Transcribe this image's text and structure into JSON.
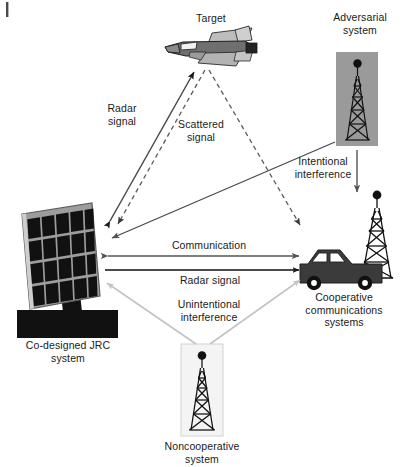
{
  "figure": {
    "kind": "joint-radar-communication-coexistence-diagram",
    "corner_mark": "",
    "background": "#ffffff",
    "ink": "#1a1a1a"
  },
  "nodes": {
    "target": {
      "label_lines": [
        "Target"
      ],
      "icon": "fighter-jet-icon",
      "colors": {
        "body": "#6f6f6f",
        "wing": "#b9b9b9",
        "dark": "#3a3a3a",
        "outline": "#1a1a1a"
      }
    },
    "adversarial": {
      "label_lines": [
        "Adversarial",
        "system"
      ],
      "icon": "lattice-tower-icon",
      "colors": {
        "panel": "#9a9a9a",
        "tower": "#111111"
      }
    },
    "jrc": {
      "label_lines": [
        "Co-designed JRC",
        "system"
      ],
      "icon": "phased-array-panel-icon",
      "colors": {
        "frame": "#9d9d9d",
        "cell": "#111111",
        "base": "#111111"
      },
      "grid": {
        "rows": 4,
        "cols": 5
      }
    },
    "cooperative": {
      "label_lines": [
        "Cooperative",
        "communications",
        "systems"
      ],
      "icon": "car-with-tower-icon",
      "colors": {
        "car": "#3b3b3b",
        "tower": "#111111",
        "window": "#ffffff"
      }
    },
    "noncooperative": {
      "label_lines": [
        "Noncooperative",
        "system"
      ],
      "icon": "lattice-tower-icon",
      "colors": {
        "panel": "#f2f2f2",
        "border": "#cfcfcf",
        "tower": "#111111"
      }
    }
  },
  "edges": [
    {
      "id": "radar-signal-to-target",
      "label_lines": [
        "Radar",
        "signal"
      ],
      "style": "solid",
      "color": "#4a4a4a",
      "arrows": "both",
      "from": "jrc",
      "to": "target"
    },
    {
      "id": "scattered-signal-to-jrc",
      "label_lines": [
        "Scattered",
        "signal"
      ],
      "style": "dashed",
      "color": "#5a5a5a",
      "arrows": "end",
      "from": "target",
      "to": "jrc"
    },
    {
      "id": "scattered-signal-to-cooperative",
      "label_lines": [],
      "style": "dashed",
      "color": "#5a5a5a",
      "arrows": "end",
      "from": "target",
      "to": "cooperative"
    },
    {
      "id": "intentional-interference-to-jrc",
      "label_lines": [
        "Intentional",
        "interference"
      ],
      "style": "solid",
      "color": "#4a4a4a",
      "arrows": "end",
      "from": "adversarial",
      "to": "jrc"
    },
    {
      "id": "intentional-interference-to-cooperative",
      "label_lines": [],
      "style": "solid",
      "color": "#5f5f5f",
      "arrows": "end",
      "from": "adversarial",
      "to": "cooperative"
    },
    {
      "id": "communication-link",
      "label_lines": [
        "Communication"
      ],
      "style": "solid",
      "color": "#555555",
      "arrows": "both",
      "from": "jrc",
      "to": "cooperative"
    },
    {
      "id": "radar-signal-link",
      "label_lines": [
        "Radar signal"
      ],
      "style": "solid",
      "color": "#111111",
      "arrows": "end",
      "from": "jrc",
      "to": "cooperative"
    },
    {
      "id": "unintentional-interference",
      "label_lines": [
        "Unintentional",
        "interference"
      ],
      "style": "solid",
      "color": "#c3c3c3",
      "arrows": "both-outward",
      "from": "noncooperative",
      "to": "jrc-and-cooperative"
    }
  ],
  "labels": {
    "target": "Target",
    "adversarial_1": "Adversarial",
    "adversarial_2": "system",
    "radar_signal_1": "Radar",
    "radar_signal_2": "signal",
    "scattered_1": "Scattered",
    "scattered_2": "signal",
    "intentional_1": "Intentional",
    "intentional_2": "interference",
    "communication": "Communication",
    "radar_signal_link": "Radar signal",
    "unintentional_1": "Unintentional",
    "unintentional_2": "interference",
    "jrc_1": "Co-designed JRC",
    "jrc_2": "system",
    "cooperative_1": "Cooperative",
    "cooperative_2": "communications",
    "cooperative_3": "systems",
    "noncoop_1": "Noncooperative",
    "noncoop_2": "system"
  }
}
